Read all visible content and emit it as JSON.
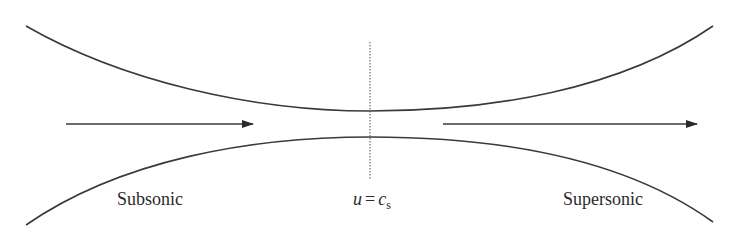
{
  "diagram": {
    "labels": {
      "left_region": "Subsonic",
      "right_region": "Supersonic",
      "throat_condition": {
        "var": "u",
        "op": "=",
        "rhs": "c",
        "rhs_sub": "s"
      }
    },
    "colors": {
      "stroke": "#3a3a3a",
      "text": "#2a2a2a",
      "background": "#ffffff"
    },
    "geometry": {
      "upper_wall": {
        "start": [
          26,
          26
        ],
        "throat": [
          370,
          111
        ],
        "end": [
          713,
          26
        ]
      },
      "lower_wall": {
        "start": [
          26,
          225
        ],
        "throat": [
          370,
          137
        ],
        "end": [
          713,
          222
        ]
      },
      "inflow_arrow": {
        "from": [
          66,
          124
        ],
        "to": [
          253,
          124
        ]
      },
      "outflow_arrow": {
        "from": [
          443,
          124
        ],
        "to": [
          697,
          124
        ]
      },
      "throat_line": {
        "x": 370,
        "y1": 42,
        "y2": 180
      }
    }
  }
}
